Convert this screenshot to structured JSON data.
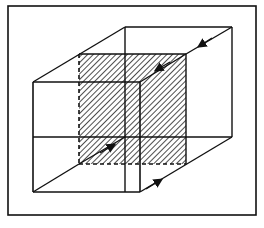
{
  "diagram": {
    "colors": {
      "stroke": "#111111",
      "background": "#ffffff",
      "hatch": "#222222"
    },
    "frame": {
      "x": 8,
      "y": 6,
      "w": 248,
      "h": 209
    },
    "front_face": [
      [
        33,
        82
      ],
      [
        140,
        82
      ],
      [
        140,
        192
      ],
      [
        33,
        192
      ]
    ],
    "back_face": [
      [
        125,
        27
      ],
      [
        232,
        27
      ],
      [
        232,
        137
      ],
      [
        125,
        137
      ]
    ],
    "hatched_plane": [
      [
        79,
        54
      ],
      [
        186,
        54
      ],
      [
        186,
        164
      ],
      [
        79,
        164
      ]
    ],
    "inner_lines": [
      {
        "from": [
          33,
          137
        ],
        "to": [
          232,
          137
        ],
        "note": "hidden horizontal through middle"
      },
      {
        "from": [
          125,
          27
        ],
        "to": [
          125,
          192
        ],
        "note": "back-left vertical continued"
      },
      {
        "from": [
          33,
          82
        ],
        "to": [
          140,
          82
        ],
        "note": "front top"
      }
    ],
    "arrows": [
      {
        "name": "arrow-top-right-edge",
        "at": [
          202,
          44
        ],
        "direction": "toward-front"
      },
      {
        "name": "arrow-inner-upper-diagonal",
        "at": [
          157,
          69
        ],
        "direction": "toward-front"
      },
      {
        "name": "arrow-inner-lower-diagonal",
        "at": [
          111,
          147
        ],
        "direction": "toward-back"
      },
      {
        "name": "arrow-bottom-right-edge",
        "at": [
          157,
          182
        ],
        "direction": "toward-back"
      }
    ]
  }
}
